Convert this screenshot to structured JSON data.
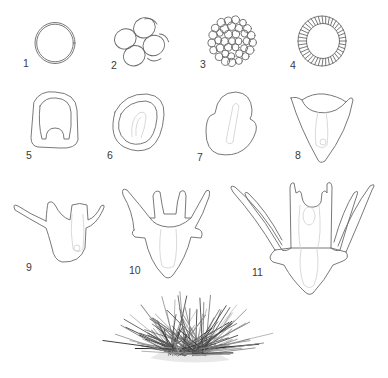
{
  "figure": {
    "stages": [
      {
        "id": 1,
        "label": "1",
        "description": "fertilized egg"
      },
      {
        "id": 2,
        "label": "2",
        "description": "cleavage, 8-cell"
      },
      {
        "id": 3,
        "label": "3",
        "description": "morula"
      },
      {
        "id": 4,
        "label": "4",
        "description": "blastula"
      },
      {
        "id": 5,
        "label": "5",
        "description": "early gastrula"
      },
      {
        "id": 6,
        "label": "6",
        "description": "gastrula"
      },
      {
        "id": 7,
        "label": "7",
        "description": "prism stage"
      },
      {
        "id": 8,
        "label": "8",
        "description": "early pluteus"
      },
      {
        "id": 9,
        "label": "9",
        "description": "2-arm pluteus"
      },
      {
        "id": 10,
        "label": "10",
        "description": "4-arm pluteus"
      },
      {
        "id": 11,
        "label": "11",
        "description": "8-arm pluteus larva"
      }
    ],
    "adult": {
      "description": "adult sea urchin"
    },
    "colors": {
      "outline": "#6a6a6a",
      "inner_detail": "#cfcfcf",
      "background": "#ffffff"
    }
  }
}
